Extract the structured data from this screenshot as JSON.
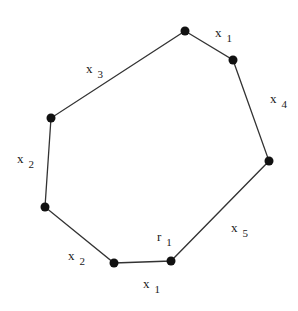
{
  "diagram": {
    "type": "polygon",
    "stroke_color": "#333333",
    "vertex_color": "#111111",
    "vertices": [
      {
        "id": "v_top",
        "x": 185,
        "y": 31
      },
      {
        "id": "v_upper_right",
        "x": 233,
        "y": 60
      },
      {
        "id": "v_right",
        "x": 269,
        "y": 161
      },
      {
        "id": "v_bottom_right",
        "x": 171,
        "y": 261
      },
      {
        "id": "v_bottom_left",
        "x": 114,
        "y": 263
      },
      {
        "id": "v_left_lower",
        "x": 45,
        "y": 207
      },
      {
        "id": "v_left_upper",
        "x": 51,
        "y": 118
      }
    ],
    "edge_labels": [
      {
        "id": "label_top_right",
        "base": "x",
        "sub": "1",
        "x": 215,
        "y": 37
      },
      {
        "id": "label_upper_left",
        "base": "x",
        "sub": "3",
        "x": 86,
        "y": 73
      },
      {
        "id": "label_right",
        "base": "x",
        "sub": "4",
        "x": 270,
        "y": 103
      },
      {
        "id": "label_left",
        "base": "x",
        "sub": "2",
        "x": 17,
        "y": 163
      },
      {
        "id": "label_lower_right",
        "base": "x",
        "sub": "5",
        "x": 231,
        "y": 232
      },
      {
        "id": "label_lower_left",
        "base": "x",
        "sub": "2",
        "x": 68,
        "y": 260
      },
      {
        "id": "label_bottom",
        "base": "x",
        "sub": "1",
        "x": 143,
        "y": 288
      }
    ],
    "vertex_labels": [
      {
        "id": "label_r1",
        "base": "r",
        "sub": "1",
        "x": 157,
        "y": 241
      }
    ]
  }
}
